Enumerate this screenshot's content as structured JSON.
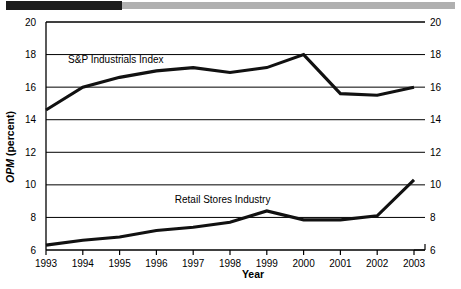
{
  "decor": {
    "dark_bar": "dark-rule",
    "gray_bar": "gray-rule"
  },
  "chart_data": {
    "type": "line",
    "title": "",
    "xlabel": "Year",
    "ylabel": "OPM (percent)",
    "ylabel_italic_part": "OPM",
    "ylabel_plain_part": " (percent)",
    "categories": [
      "1993",
      "1994",
      "1995",
      "1996",
      "1997",
      "1998",
      "1999",
      "2000",
      "2001",
      "2002",
      "2003"
    ],
    "x": [
      1993,
      1994,
      1995,
      1996,
      1997,
      1998,
      1999,
      2000,
      2001,
      2002,
      2003
    ],
    "ylim": [
      6,
      20
    ],
    "xlim": [
      1993,
      2003
    ],
    "yticks": [
      6,
      8,
      10,
      12,
      14,
      16,
      18,
      20
    ],
    "ytick_labels": [
      "6",
      "8",
      "10",
      "12",
      "14",
      "16",
      "18",
      "20"
    ],
    "ytick_labels_right": [
      "6",
      "8",
      "10",
      "12",
      "14",
      "16",
      "18",
      "20"
    ],
    "grid": "horizontal",
    "legend": "inline-labels",
    "series": [
      {
        "name": "S&P Industrials Index",
        "label_x": 1993.6,
        "label_y": 17.5,
        "values": [
          14.6,
          16.0,
          16.6,
          17.0,
          17.2,
          16.9,
          17.2,
          18.0,
          15.6,
          15.5,
          16.0
        ]
      },
      {
        "name": "Retail Stores Industry",
        "label_x": 1996.5,
        "label_y": 8.9,
        "values": [
          6.3,
          6.6,
          6.8,
          7.2,
          7.4,
          7.7,
          8.4,
          7.85,
          7.85,
          8.1,
          10.3
        ]
      }
    ]
  }
}
